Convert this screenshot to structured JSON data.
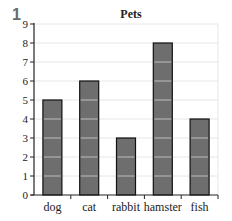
{
  "question_number": "1",
  "chart_data": {
    "type": "bar",
    "title": "Pets",
    "xlabel": "",
    "ylabel": "",
    "categories": [
      "dog",
      "cat",
      "rabbit",
      "hamster",
      "fish"
    ],
    "values": [
      5,
      6,
      3,
      8,
      4
    ],
    "ylim": [
      0,
      9
    ],
    "yticks": [
      0,
      1,
      2,
      3,
      4,
      5,
      6,
      7,
      8,
      9
    ],
    "grid": true,
    "bar_color": "#6e6e6e",
    "bar_edge_color": "#111111",
    "grid_color": "#e6e6e6",
    "bar_unit_line_color": "#bdbdbd"
  }
}
